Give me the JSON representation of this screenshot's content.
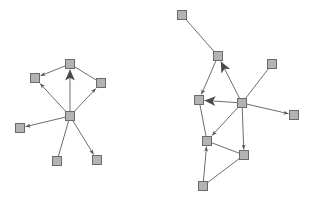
{
  "diagram": {
    "type": "directed-graph-pair",
    "style": {
      "node_fill": "#b3b3b3",
      "node_stroke": "#6a6a6a",
      "edge_color": "#6e6e6e",
      "arrow_color": "#555555",
      "background": "#ffffff"
    },
    "graphs": [
      {
        "id": "left-graph",
        "nodes": [
          {
            "id": "L1",
            "x": 70,
            "y": 64
          },
          {
            "id": "L2",
            "x": 35,
            "y": 78
          },
          {
            "id": "L3",
            "x": 101,
            "y": 83
          },
          {
            "id": "L4",
            "x": 70,
            "y": 116
          },
          {
            "id": "L5",
            "x": 20,
            "y": 128
          },
          {
            "id": "L6",
            "x": 57,
            "y": 161
          },
          {
            "id": "L7",
            "x": 97,
            "y": 160
          }
        ],
        "edges": [
          {
            "from": "L4",
            "to": "L1",
            "arrow": "large"
          },
          {
            "from": "L1",
            "to": "L2",
            "arrow": "small"
          },
          {
            "from": "L1",
            "to": "L3",
            "arrow": "none"
          },
          {
            "from": "L4",
            "to": "L2",
            "arrow": "small"
          },
          {
            "from": "L4",
            "to": "L3",
            "arrow": "small"
          },
          {
            "from": "L4",
            "to": "L5",
            "arrow": "small"
          },
          {
            "from": "L6",
            "to": "L4",
            "arrow": "none"
          },
          {
            "from": "L4",
            "to": "L7",
            "arrow": "small"
          }
        ]
      },
      {
        "id": "right-graph",
        "nodes": [
          {
            "id": "R1",
            "x": 182,
            "y": 15
          },
          {
            "id": "R2",
            "x": 218,
            "y": 56
          },
          {
            "id": "R3",
            "x": 272,
            "y": 64
          },
          {
            "id": "R4",
            "x": 199,
            "y": 100
          },
          {
            "id": "R5",
            "x": 242,
            "y": 103
          },
          {
            "id": "R6",
            "x": 294,
            "y": 115
          },
          {
            "id": "R7",
            "x": 207,
            "y": 141
          },
          {
            "id": "R8",
            "x": 244,
            "y": 155
          },
          {
            "id": "R9",
            "x": 203,
            "y": 186
          }
        ],
        "edges": [
          {
            "from": "R1",
            "to": "R2",
            "arrow": "none"
          },
          {
            "from": "R2",
            "to": "R4",
            "arrow": "small"
          },
          {
            "from": "R5",
            "to": "R2",
            "arrow": "large"
          },
          {
            "from": "R3",
            "to": "R5",
            "arrow": "none"
          },
          {
            "from": "R5",
            "to": "R4",
            "arrow": "large"
          },
          {
            "from": "R5",
            "to": "R6",
            "arrow": "small"
          },
          {
            "from": "R5",
            "to": "R7",
            "arrow": "small"
          },
          {
            "from": "R4",
            "to": "R7",
            "arrow": "none"
          },
          {
            "from": "R5",
            "to": "R8",
            "arrow": "small"
          },
          {
            "from": "R7",
            "to": "R8",
            "arrow": "none"
          },
          {
            "from": "R9",
            "to": "R7",
            "arrow": "small"
          },
          {
            "from": "R9",
            "to": "R8",
            "arrow": "none"
          }
        ]
      }
    ]
  }
}
